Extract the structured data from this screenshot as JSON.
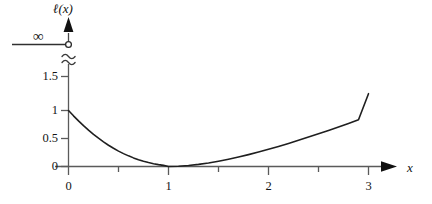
{
  "chart_data": {
    "type": "line",
    "title": "",
    "xlabel": "x",
    "ylabel": "ℓ(x)",
    "xlim": [
      0,
      3.2
    ],
    "ylim": [
      0,
      1.5
    ],
    "grid": false,
    "legend": null,
    "x_ticks": [
      {
        "value": 0,
        "label": "0",
        "major": true
      },
      {
        "value": 0.5,
        "label": "",
        "major": false
      },
      {
        "value": 1,
        "label": "1",
        "major": true
      },
      {
        "value": 1.5,
        "label": "",
        "major": false
      },
      {
        "value": 2,
        "label": "2",
        "major": true
      },
      {
        "value": 2.5,
        "label": "",
        "major": false
      },
      {
        "value": 3,
        "label": "3",
        "major": true
      }
    ],
    "y_ticks": [
      {
        "value": 0,
        "label": "0"
      },
      {
        "value": 0.5,
        "label": "0.5"
      },
      {
        "value": 1,
        "label": "1"
      },
      {
        "value": 1.5,
        "label": "1.5"
      }
    ],
    "axis_break": {
      "present": true,
      "style": "double-squiggle",
      "above_label": "∞",
      "marker": "open-circle"
    },
    "series": [
      {
        "name": "ℓ(x)",
        "color": "#1f1f1f",
        "x": [
          0.0,
          0.05,
          0.1,
          0.15,
          0.2,
          0.25,
          0.3,
          0.35,
          0.4,
          0.45,
          0.5,
          0.55,
          0.6,
          0.65,
          0.7,
          0.75,
          0.8,
          0.85,
          0.9,
          0.95,
          1.0,
          1.1,
          1.2,
          1.3,
          1.4,
          1.5,
          1.6,
          1.7,
          1.8,
          1.9,
          2.0,
          2.1,
          2.2,
          2.3,
          2.4,
          2.5,
          2.6,
          2.7,
          2.8,
          2.9,
          3.0
        ],
        "y": [
          1.0,
          0.905,
          0.815,
          0.73,
          0.65,
          0.575,
          0.505,
          0.44,
          0.38,
          0.325,
          0.275,
          0.23,
          0.19,
          0.154,
          0.122,
          0.094,
          0.07,
          0.05,
          0.033,
          0.02,
          0.0,
          0.005,
          0.018,
          0.038,
          0.064,
          0.095,
          0.13,
          0.169,
          0.212,
          0.258,
          0.307,
          0.358,
          0.412,
          0.467,
          0.525,
          0.584,
          0.644,
          0.706,
          0.77,
          0.835,
          1.3
        ]
      }
    ],
    "annotations": [
      {
        "text": "∞",
        "at_y": "above-break",
        "leader_line": true
      }
    ]
  },
  "axis_labels": {
    "x_axis_name": "x",
    "y_axis_name": "ℓ(x)",
    "infinity": "∞"
  }
}
